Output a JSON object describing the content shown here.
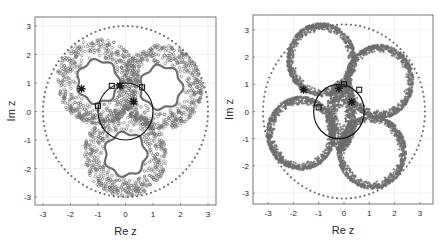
{
  "chart_data": [
    {
      "type": "scatter",
      "title": "",
      "xlabel": "Re z",
      "ylabel": "Im z",
      "xlim": [
        -3.3,
        3.3
      ],
      "ylim": [
        -3.3,
        3.3
      ],
      "xticks": [
        -3,
        -2,
        -1,
        0,
        1,
        2,
        3
      ],
      "yticks": [
        -3,
        -2,
        -1,
        0,
        1,
        2,
        3
      ],
      "grid": true,
      "series": [
        {
          "name": "outer dotted circle",
          "shape": "circle",
          "center": [
            0,
            0
          ],
          "radius": 3.0,
          "style": "dots"
        },
        {
          "name": "unit circle",
          "shape": "circle",
          "center": [
            0,
            0
          ],
          "radius": 1.0,
          "style": "line"
        },
        {
          "name": "annulus 1",
          "shape": "annulus",
          "center": [
            -1.0,
            1.05
          ],
          "inner": 0.75,
          "outer": 1.5,
          "style": "circles"
        },
        {
          "name": "annulus 2",
          "shape": "annulus",
          "center": [
            1.3,
            0.85
          ],
          "inner": 0.75,
          "outer": 1.5,
          "style": "circles"
        },
        {
          "name": "annulus 3",
          "shape": "annulus",
          "center": [
            0.0,
            -1.5
          ],
          "inner": 0.75,
          "outer": 1.5,
          "style": "circles"
        },
        {
          "name": "stars",
          "marker": "asterisk",
          "points": [
            [
              -1.6,
              0.8
            ],
            [
              -0.2,
              0.9
            ],
            [
              0.3,
              0.35
            ]
          ]
        },
        {
          "name": "squares",
          "marker": "square",
          "points": [
            [
              -1.0,
              0.2
            ],
            [
              -0.5,
              0.9
            ],
            [
              0.6,
              0.85
            ]
          ]
        }
      ]
    },
    {
      "type": "scatter",
      "title": "",
      "xlabel": "Re z",
      "ylabel": "Im z",
      "xlim": [
        -3.6,
        3.5
      ],
      "ylim": [
        -3.5,
        3.5
      ],
      "xticks": [
        -3,
        -2,
        -1,
        0,
        1,
        2,
        3
      ],
      "yticks": [
        -3,
        -2,
        -1,
        0,
        1,
        2,
        3
      ],
      "grid": true,
      "series": [
        {
          "name": "outer dotted circle",
          "shape": "circle",
          "center": [
            0,
            0
          ],
          "radius": 3.2,
          "style": "dots"
        },
        {
          "name": "unit circle",
          "shape": "circle",
          "center": [
            -0.2,
            0
          ],
          "radius": 1.0,
          "style": "line"
        },
        {
          "name": "ring 1",
          "shape": "annulus",
          "center": [
            -0.9,
            1.9
          ],
          "inner": 1.05,
          "outer": 1.35,
          "style": "stars"
        },
        {
          "name": "ring 2",
          "shape": "annulus",
          "center": [
            1.4,
            1.1
          ],
          "inner": 1.05,
          "outer": 1.35,
          "style": "stars"
        },
        {
          "name": "ring 3",
          "shape": "annulus",
          "center": [
            1.1,
            -1.5
          ],
          "inner": 1.05,
          "outer": 1.35,
          "style": "stars"
        },
        {
          "name": "ring 4",
          "shape": "annulus",
          "center": [
            -1.7,
            -0.8
          ],
          "inner": 1.05,
          "outer": 1.35,
          "style": "stars"
        },
        {
          "name": "ring 5",
          "shape": "annulus",
          "center": [
            -0.1,
            -0.15
          ],
          "inner": 0.3,
          "outer": 1.3,
          "style": "stars",
          "scaleX": 0.45
        },
        {
          "name": "stars",
          "marker": "asterisk",
          "points": [
            [
              -1.6,
              0.8
            ],
            [
              -0.2,
              0.85
            ],
            [
              0.3,
              0.35
            ]
          ]
        },
        {
          "name": "squares",
          "marker": "square",
          "points": [
            [
              -1.0,
              0.15
            ],
            [
              0.0,
              1.0
            ],
            [
              0.6,
              0.8
            ]
          ]
        }
      ]
    }
  ],
  "panels": [
    {
      "xlabel": "Re z",
      "ylabel": "Im z",
      "ticks": [
        "-3",
        "-2",
        "-1",
        "0",
        "1",
        "2",
        "3"
      ]
    },
    {
      "xlabel": "Re z",
      "ylabel": "Im z",
      "ticks": [
        "-3",
        "-2",
        "-1",
        "0",
        "1",
        "2",
        "3"
      ]
    }
  ],
  "colors": {
    "points": "#6e6e6e",
    "line": "#1a1a1a",
    "grid": "#e8e8e8",
    "axis": "#555555"
  }
}
